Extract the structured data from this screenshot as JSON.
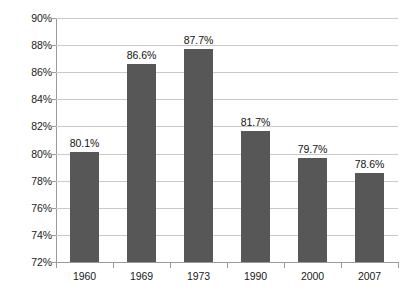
{
  "chart_data": {
    "type": "bar",
    "title": "",
    "subtitle": "",
    "xlabel": "",
    "ylabel": "",
    "categories": [
      "1960",
      "1969",
      "1973",
      "1990",
      "2000",
      "2007"
    ],
    "values": [
      80.1,
      86.6,
      87.7,
      81.7,
      79.7,
      78.6
    ],
    "data_labels": [
      "80.1%",
      "86.6%",
      "87.7%",
      "81.7%",
      "79.7%",
      "78.6%"
    ],
    "ylim": [
      72,
      90
    ],
    "ytick_step": 2,
    "ytick_values": [
      90,
      88,
      86,
      84,
      82,
      80,
      78,
      76,
      74,
      72
    ],
    "ytick_labels": [
      "90%",
      "88%",
      "86%",
      "84%",
      "82%",
      "80%",
      "78%",
      "76%",
      "74%",
      "72%"
    ],
    "grid": true,
    "grid_axis": "y",
    "legend": false,
    "legend_position": "none",
    "series": [
      {
        "name": "",
        "values": [
          80.1,
          86.6,
          87.7,
          81.7,
          79.7,
          78.6
        ]
      }
    ],
    "colors": {
      "bar": "#575757",
      "gridline": "#c9c9c9",
      "axis": "#9a9a9a",
      "text": "#1a1a1a",
      "background": "#ffffff"
    }
  }
}
